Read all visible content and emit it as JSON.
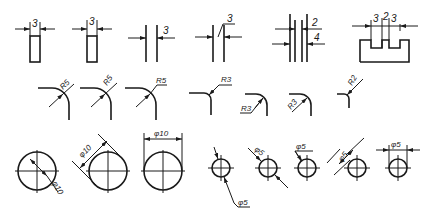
{
  "figure": {
    "row1_linear_dimensions": {
      "fig1_label": "3",
      "fig2_label": "3",
      "fig3_label": "3",
      "fig4_label": "3",
      "fig5_label_top": "2",
      "fig5_label_bottom": "4",
      "fig6_labels": [
        "3",
        "2",
        "3"
      ]
    },
    "row2_radius_dimensions": {
      "labels": [
        "R5",
        "R5",
        "R5",
        "R3",
        "R3",
        "R3",
        "R2"
      ]
    },
    "row3_diameter_dimensions": {
      "large_labels": [
        "φ10",
        "φ10",
        "φ10"
      ],
      "small_labels": [
        "φ5",
        "φ5",
        "φ5",
        "φ5",
        "φ5"
      ]
    },
    "caption": ""
  },
  "colors": {
    "line": "#1a1a1a",
    "background": "#ffffff"
  }
}
